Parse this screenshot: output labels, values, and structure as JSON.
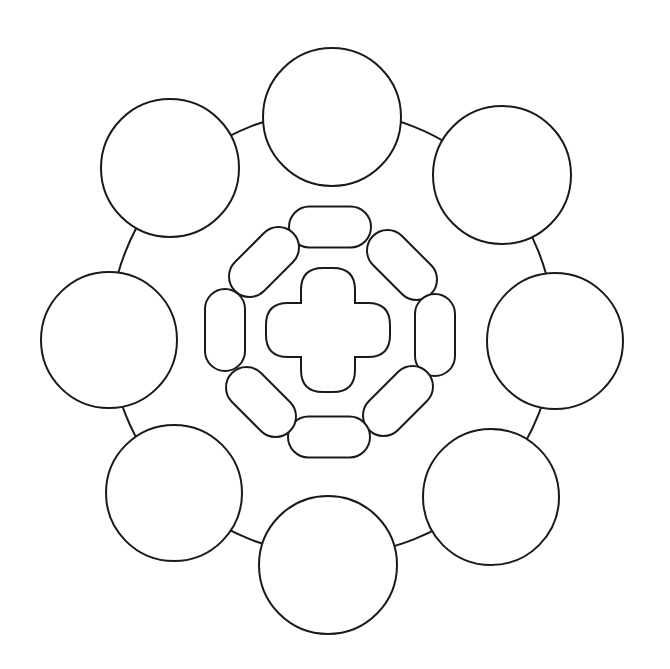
{
  "diagram": {
    "type": "radial-circle-template",
    "stroke_color": "#1a1a1a",
    "background": "#ffffff",
    "center": [
      332,
      333
    ],
    "outer_ring": {
      "radius": 222
    },
    "outer_circles": [
      {
        "id": "top",
        "cx": 332,
        "cy": 117,
        "r": 69
      },
      {
        "id": "top-right",
        "cx": 502,
        "cy": 175,
        "r": 69
      },
      {
        "id": "right",
        "cx": 555,
        "cy": 341,
        "r": 68
      },
      {
        "id": "bottom-right",
        "cx": 491,
        "cy": 497,
        "r": 68
      },
      {
        "id": "bottom",
        "cx": 328,
        "cy": 565,
        "r": 69
      },
      {
        "id": "bottom-left",
        "cx": 174,
        "cy": 493,
        "r": 68
      },
      {
        "id": "left",
        "cx": 109,
        "cy": 340,
        "r": 68
      },
      {
        "id": "top-left",
        "cx": 170,
        "cy": 168,
        "r": 69
      }
    ],
    "inner_pills": [
      {
        "id": "pill-top",
        "cx": 330,
        "cy": 227,
        "w": 82,
        "h": 41,
        "angle": 0
      },
      {
        "id": "pill-top-right",
        "cx": 402,
        "cy": 265,
        "w": 82,
        "h": 41,
        "angle": 45
      },
      {
        "id": "pill-right",
        "cx": 435,
        "cy": 335,
        "w": 82,
        "h": 40,
        "angle": 90
      },
      {
        "id": "pill-bottom-right",
        "cx": 398,
        "cy": 401,
        "w": 82,
        "h": 41,
        "angle": -45
      },
      {
        "id": "pill-bottom",
        "cx": 329,
        "cy": 437,
        "w": 82,
        "h": 41,
        "angle": 0
      },
      {
        "id": "pill-bottom-left",
        "cx": 261,
        "cy": 402,
        "w": 82,
        "h": 41,
        "angle": 45
      },
      {
        "id": "pill-left",
        "cx": 225,
        "cy": 330,
        "w": 82,
        "h": 40,
        "angle": 90
      },
      {
        "id": "pill-top-left",
        "cx": 264,
        "cy": 262,
        "w": 82,
        "h": 41,
        "angle": -45
      }
    ],
    "center_cross": {
      "cx": 328,
      "cy": 330,
      "arm_width": 54,
      "span": 124,
      "corner_radius": 22
    }
  }
}
